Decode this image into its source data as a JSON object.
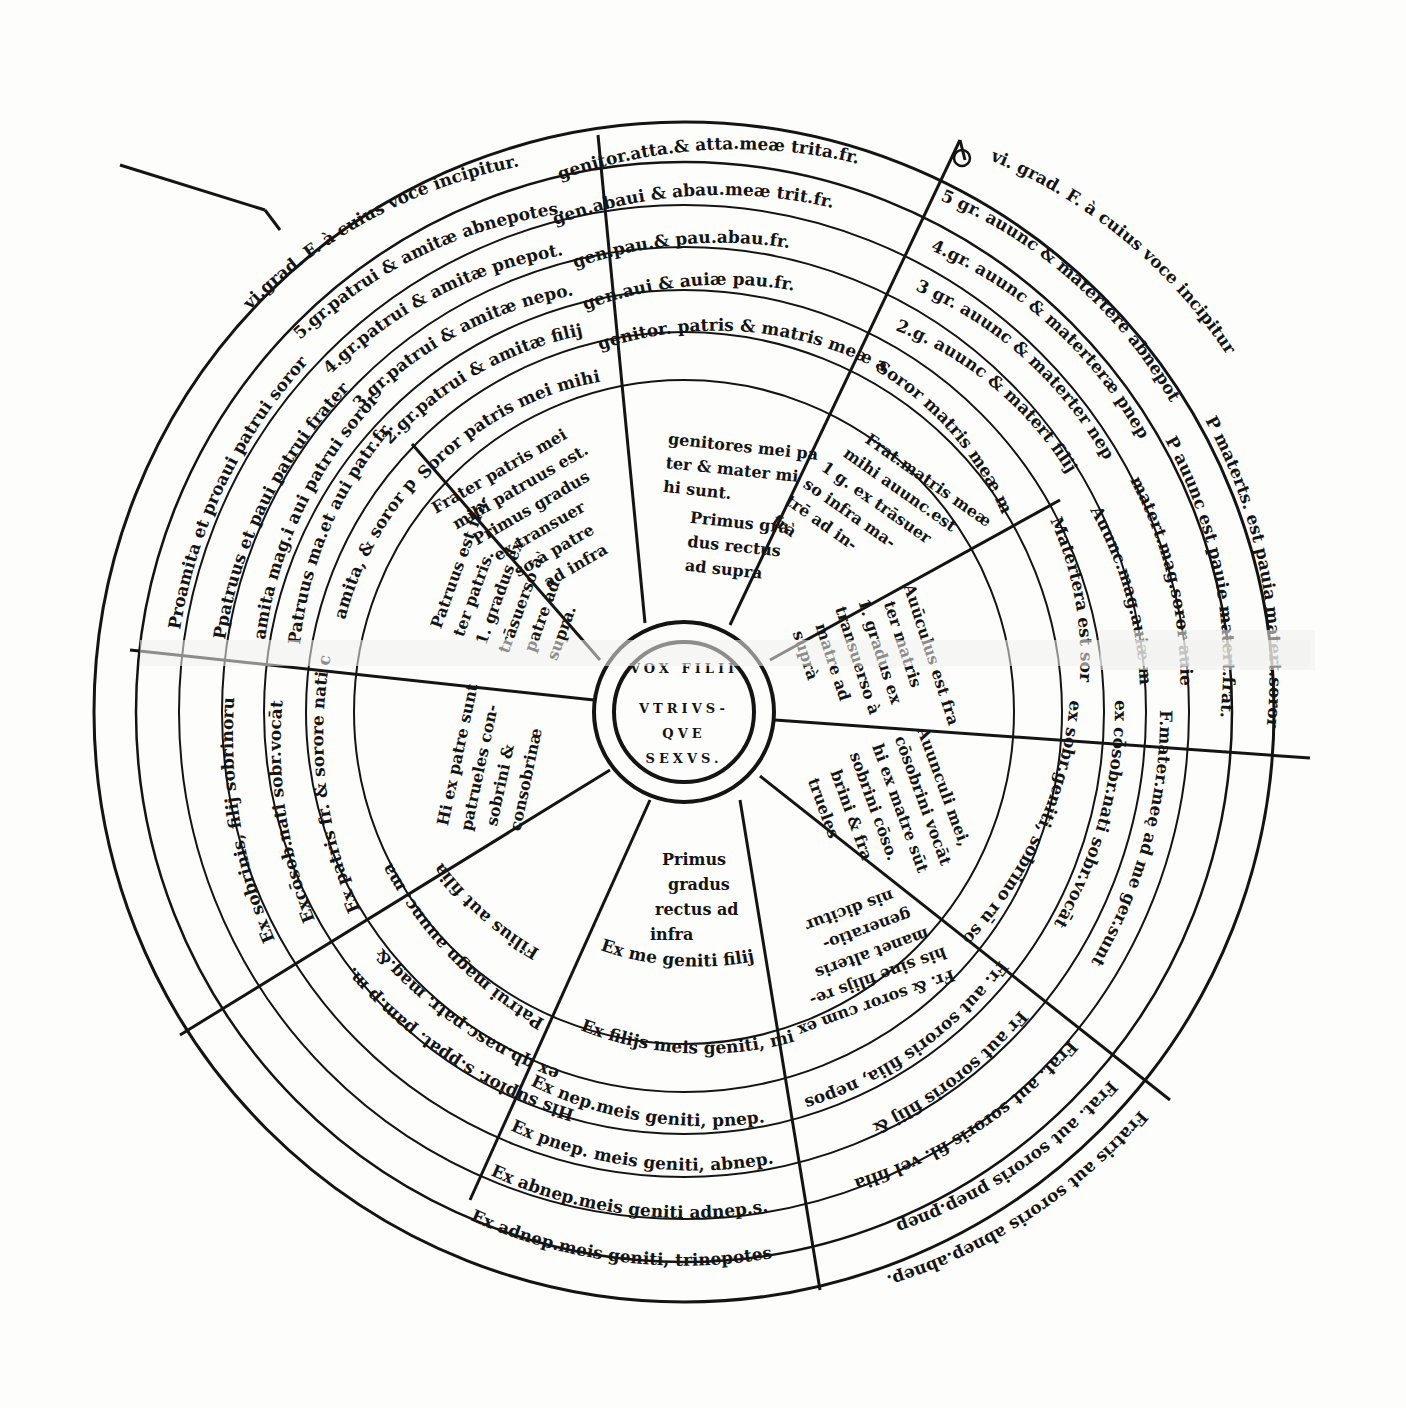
{
  "diagram": {
    "title_center": [
      "VOX FILII",
      "VTRIVS-",
      "QVE",
      "SEXVS."
    ],
    "colors": {
      "paper": "#fdfdfb",
      "ink": "#141414",
      "ghost": "#ececea"
    },
    "top_sector": {
      "rings": [
        "genitor.atta.& atta.meæ trita.fr.",
        "gen.abaui & abau.meæ trit.fr.",
        "gen.pau.& pau.abau.fr.",
        "gen.aui & auiæ pau.fr.",
        "genitor. patris & matris meæ aui mihi fr."
      ],
      "inner": [
        "genitores mei pa",
        "ter & mater mi",
        "hi sunt.",
        "Primus gra",
        "dus rectus",
        "ad supra"
      ]
    },
    "upper_left_sector": {
      "rings": [
        "vi.grad. F. à cuius voce incipitur.",
        "5.gr.patrui & amitæ abnepotes.",
        "4.gr.patrui & amitæ pnepot.",
        "3.gr.patrui & amitæ nepo.",
        "2.gr.patrui & amitæ filij",
        "Soror patris mei mihi amita est."
      ],
      "inner": [
        "Frater patris mei",
        "mihi patruus est.",
        "Primus gradus",
        "ex transuer",
        "so à patre",
        "ad infra"
      ]
    },
    "upper_right_sector": {
      "rings": [
        "vi. grad. F. à cuius voce incipitur",
        "5 gr. auunc & matertere abnepot",
        "4.gr. auunc & materteræ pnep",
        "3 gr. auunc & materter nep",
        "2.g. auunc & matert filij",
        "Soror matris meæ mihi sunt"
      ],
      "inner": [
        "Frat.matris meæ",
        "mihi auunc.est",
        "1 g. ex trāsuer",
        "so infra ma-",
        "trē ad in-",
        "frà"
      ]
    },
    "left_sector": {
      "rings": [
        "Proamita et proaui patrui soror",
        "Ppatruus et paui patrui frater",
        "amita mag.i aui patrui soror",
        "Patruus ma.et aui patr.fr.",
        "amita, & soror patris."
      ],
      "inner": [
        "Patruus est fra-",
        "ter patris.",
        "1. gradus ex",
        "trāsuerso à",
        "patre ad",
        "supra."
      ]
    },
    "right_sector": {
      "rings": [
        "P materts. est pauia matert.soror",
        "P auunc est pauie matert.frat.",
        "matert.mag.soror auie mat",
        "Auunc.mag.auiæ mat fr.",
        "Matertera est soror matris"
      ],
      "inner": [
        "Auūculus est fra",
        "ter matris",
        "1. gradus ex",
        "transuerso à",
        "matre ad",
        "suprà"
      ]
    },
    "lower_left_sector": {
      "rings": [
        "Ex sobrinis, filij sobrinorum",
        "Excōsob.nati sobr.vocāt",
        "Ex patris fr. & sorore nati consob.dicunt"
      ],
      "inner": [
        "Hi ex patre sunt",
        "patrueles con-",
        "sobrini &",
        "consobrinæ"
      ]
    },
    "lower_right_sector": {
      "rings": [
        "F.mater.meę ad me ger.sunt",
        "ex cōsobr.nati sobr.vocāt",
        "ex sobr.geniti, sobrino rū sobrin. ff.vocant."
      ],
      "inner": [
        "Auunculi mei,",
        "cōsobrini vocāt",
        "hi ex matre sūt",
        "sobrini cōso.",
        "brini & fra",
        "trueles"
      ]
    },
    "bottom_left_sector": {
      "rings": [
        "His supior. s.ppat. pam.p m.",
        "ex qb.nasc.patr. mag.&",
        "Patrui magn auunc. matertera magna",
        "Filius aut filia vel priores sobrini sunt."
      ]
    },
    "bottom_sector": {
      "inner": [
        "Primus",
        "gradus",
        "rectus ad",
        "infra"
      ],
      "rings": [
        "Ex me geniti filij mei sunt.",
        "Ex filijs meis geniti, mihi nepotes sunt",
        "Ex nep.meis geniti, pnep.",
        "Ex pnep. meis geniti, abnep.",
        "Ex abnep.meis geniti adnep.s.",
        "Ex adnep.meis geniti, trinepotes"
      ]
    },
    "bottom_right_sector": {
      "inner": [
        "Fr. & soror cum ex",
        "his sine filijs re-",
        "manet alteris",
        "generatio-",
        "nis dicitur"
      ],
      "rings": [
        "Fr. aut sororis filia, nepos & neptis",
        "Fr aut sororis filij &",
        "Frat. aut sororis fil. vel filia",
        "Frat. aut sororis pnep.pnep",
        "Fratris aut sororis abnep.abnep.",
        "Fratris aut sororis adnep.adnep."
      ]
    }
  }
}
